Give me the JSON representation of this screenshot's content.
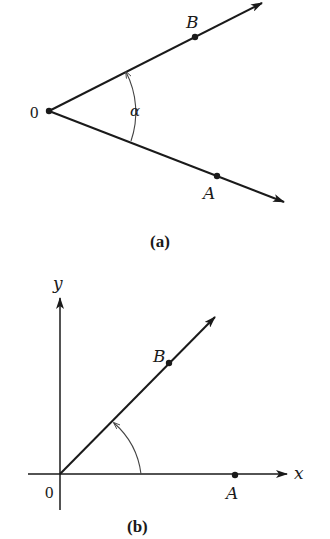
{
  "figure_a": {
    "caption": "(a)",
    "vertex_label": "0",
    "point_b_label": "B",
    "point_a_label": "A",
    "angle_label": "α"
  },
  "figure_b": {
    "caption": "(b)",
    "origin_label": "0",
    "x_axis_label": "x",
    "y_axis_label": "y",
    "point_b_label": "B",
    "point_a_label": "A"
  },
  "colors": {
    "ink": "#1a1a1a",
    "arc": "#444444",
    "background": "#ffffff"
  }
}
